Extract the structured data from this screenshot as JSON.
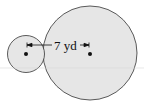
{
  "diagram": {
    "type": "two-circles",
    "label": "7 yd",
    "small_circle": {
      "cx": 26,
      "cy": 54,
      "r": 18.5
    },
    "large_circle": {
      "cx": 90,
      "cy": 53,
      "r": 47
    },
    "fill_color": "#e6e6e6",
    "stroke_color": "#333333",
    "dimension": {
      "from_x": 27,
      "to_x": 89,
      "y": 45,
      "value": "7 yd"
    }
  }
}
